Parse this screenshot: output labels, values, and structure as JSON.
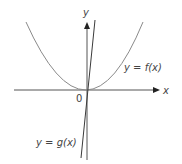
{
  "diagram": {
    "axes": {
      "x_label": "x",
      "y_label": "y",
      "origin_label": "0"
    },
    "curves": [
      {
        "id": "f",
        "label": "y = f(x)",
        "kind": "parabola",
        "vertex_at_origin": true
      },
      {
        "id": "g",
        "label": "y = g(x)",
        "kind": "steep line through origin"
      }
    ],
    "colors": {
      "curve_f": "#8a8a8a",
      "line_g": "#3a3a3a",
      "axis": "#555555",
      "text": "#444444"
    }
  }
}
